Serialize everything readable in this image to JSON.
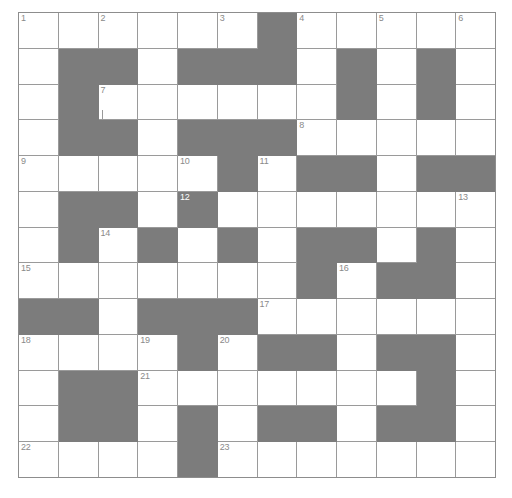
{
  "puzzle": {
    "title": "Crossword Grid",
    "type": "crossword",
    "columns": 12,
    "rows": 13,
    "cell_width": 39.83,
    "cell_height": 35.85,
    "colors": {
      "background": "#ffffff",
      "block_fill": "#7c7c7c",
      "grid_line": "#9a9a9a",
      "border": "#8d8d8d",
      "number_text": "#8a8a8a"
    },
    "block_cells": [
      [
        1,
        7
      ],
      [
        2,
        2
      ],
      [
        2,
        3
      ],
      [
        2,
        5
      ],
      [
        2,
        6
      ],
      [
        2,
        7
      ],
      [
        2,
        9
      ],
      [
        2,
        11
      ],
      [
        3,
        2
      ],
      [
        3,
        9
      ],
      [
        3,
        11
      ],
      [
        4,
        2
      ],
      [
        4,
        3
      ],
      [
        4,
        5
      ],
      [
        4,
        6
      ],
      [
        4,
        7
      ],
      [
        5,
        6
      ],
      [
        5,
        8
      ],
      [
        5,
        9
      ],
      [
        5,
        11
      ],
      [
        5,
        12
      ],
      [
        6,
        2
      ],
      [
        6,
        3
      ],
      [
        6,
        5
      ],
      [
        7,
        2
      ],
      [
        7,
        4
      ],
      [
        7,
        6
      ],
      [
        7,
        8
      ],
      [
        7,
        9
      ],
      [
        7,
        11
      ],
      [
        8,
        8
      ],
      [
        8,
        10
      ],
      [
        8,
        11
      ],
      [
        9,
        1
      ],
      [
        9,
        2
      ],
      [
        9,
        4
      ],
      [
        9,
        5
      ],
      [
        9,
        6
      ],
      [
        10,
        5
      ],
      [
        10,
        7
      ],
      [
        10,
        8
      ],
      [
        10,
        10
      ],
      [
        10,
        11
      ],
      [
        11,
        2
      ],
      [
        11,
        3
      ],
      [
        11,
        11
      ],
      [
        12,
        2
      ],
      [
        12,
        3
      ],
      [
        12,
        5
      ],
      [
        12,
        7
      ],
      [
        12,
        8
      ],
      [
        12,
        10
      ],
      [
        12,
        11
      ],
      [
        13,
        5
      ]
    ],
    "numbered_cells": [
      {
        "number": "1",
        "row": 1,
        "col": 1
      },
      {
        "number": "2",
        "row": 1,
        "col": 3
      },
      {
        "number": "3",
        "row": 1,
        "col": 6
      },
      {
        "number": "4",
        "row": 1,
        "col": 8
      },
      {
        "number": "5",
        "row": 1,
        "col": 10
      },
      {
        "number": "6",
        "row": 1,
        "col": 12
      },
      {
        "number": "7",
        "row": 3,
        "col": 3
      },
      {
        "number": "8",
        "row": 4,
        "col": 8
      },
      {
        "number": "9",
        "row": 5,
        "col": 1
      },
      {
        "number": "10",
        "row": 5,
        "col": 5
      },
      {
        "number": "11",
        "row": 5,
        "col": 7
      },
      {
        "number": "12",
        "row": 6,
        "col": 5
      },
      {
        "number": "13",
        "row": 6,
        "col": 12
      },
      {
        "number": "14",
        "row": 7,
        "col": 3
      },
      {
        "number": "15",
        "row": 8,
        "col": 1
      },
      {
        "number": "16",
        "row": 8,
        "col": 9
      },
      {
        "number": "17",
        "row": 9,
        "col": 7
      },
      {
        "number": "18",
        "row": 10,
        "col": 1
      },
      {
        "number": "19",
        "row": 10,
        "col": 4
      },
      {
        "number": "20",
        "row": 10,
        "col": 6
      },
      {
        "number": "21",
        "row": 11,
        "col": 4
      },
      {
        "number": "22",
        "row": 13,
        "col": 1
      },
      {
        "number": "23",
        "row": 13,
        "col": 6
      }
    ],
    "filled_letters": [],
    "artifact_marks": [
      {
        "row": 3,
        "col": 3,
        "kind": "tick"
      }
    ]
  }
}
